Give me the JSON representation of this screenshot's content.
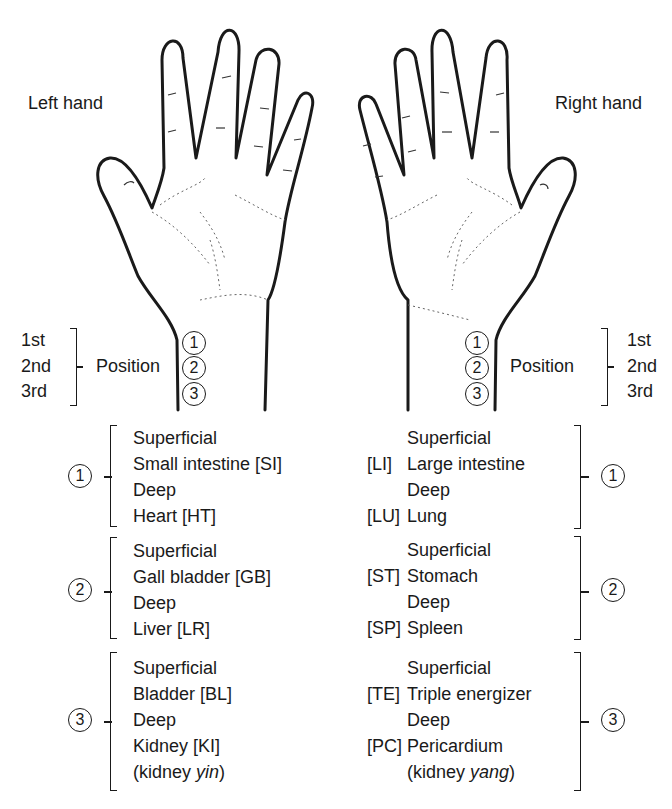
{
  "labels": {
    "left_hand": "Left hand",
    "right_hand": "Right hand",
    "position": "Position"
  },
  "position_orders": [
    "1st",
    "2nd",
    "3rd"
  ],
  "circled_numbers": [
    "1",
    "2",
    "3"
  ],
  "left_hand_groups": [
    {
      "position": "1",
      "lines": [
        "Superficial",
        "Small intestine [SI]",
        "Deep",
        "Heart [HT]"
      ]
    },
    {
      "position": "2",
      "lines": [
        "Superficial",
        "Gall bladder [GB]",
        "Deep",
        "Liver [LR]"
      ]
    },
    {
      "position": "3",
      "lines": [
        "Superficial",
        "Bladder [BL]",
        "Deep",
        "Kidney [KI]"
      ],
      "note_prefix": "(kidney ",
      "note_italic": "yin",
      "note_suffix": ")"
    }
  ],
  "right_hand_groups": [
    {
      "position": "1",
      "rows": [
        {
          "abbr": "",
          "text": "Superficial"
        },
        {
          "abbr": "[LI]",
          "text": "Large intestine"
        },
        {
          "abbr": "",
          "text": "Deep"
        },
        {
          "abbr": "[LU]",
          "text": "Lung"
        }
      ]
    },
    {
      "position": "2",
      "rows": [
        {
          "abbr": "",
          "text": "Superficial"
        },
        {
          "abbr": "[ST]",
          "text": "Stomach"
        },
        {
          "abbr": "",
          "text": "Deep"
        },
        {
          "abbr": "[SP]",
          "text": "Spleen"
        }
      ]
    },
    {
      "position": "3",
      "rows": [
        {
          "abbr": "",
          "text": "Superficial"
        },
        {
          "abbr": "[TE]",
          "text": "Triple energizer"
        },
        {
          "abbr": "",
          "text": "Deep"
        },
        {
          "abbr": "[PC]",
          "text": "Pericardium"
        }
      ],
      "note_prefix": "(kidney ",
      "note_italic": "yang",
      "note_suffix": ")"
    }
  ],
  "colors": {
    "ink": "#1a1a1a",
    "background": "#ffffff"
  }
}
